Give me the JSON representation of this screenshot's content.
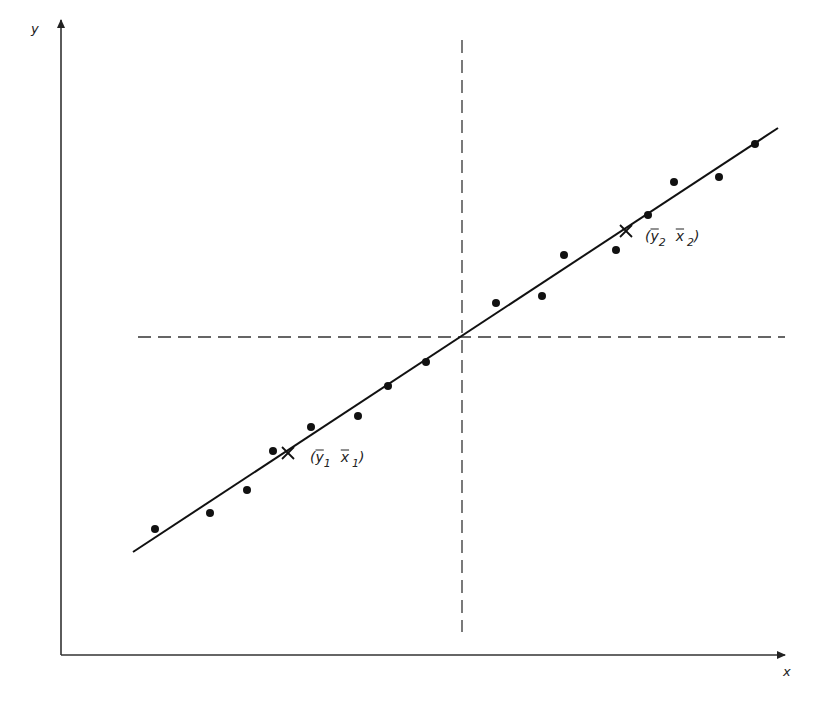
{
  "diagram": {
    "title": "",
    "axes": {
      "x_label": "x",
      "y_label": "y",
      "origin_px": [
        61,
        655
      ],
      "x_end_px": [
        785,
        655
      ],
      "y_end_px": [
        61,
        20
      ]
    },
    "reference_lines": {
      "vertical_dashed_x_px": 462,
      "vertical_dashed_range_px": [
        40,
        632
      ],
      "horizontal_dashed_y_px": 337,
      "horizontal_dashed_range_px": [
        138,
        785
      ],
      "description": "dashed lines through the grand mean"
    },
    "regression_line": {
      "start_px": [
        133,
        552
      ],
      "end_px": [
        778,
        128
      ],
      "passes_through": "grand mean (intersection of dashed lines)"
    },
    "group_means": [
      {
        "label_open": "(",
        "y_sym": "y",
        "y_sub": "1",
        "x_sym": "x",
        "x_sub": "1",
        "label_close": ")",
        "marker_px": [
          288,
          453
        ],
        "label_px": [
          310,
          462
        ]
      },
      {
        "label_open": "(",
        "y_sym": "y",
        "y_sub": "2",
        "x_sym": "x",
        "x_sub": "2",
        "label_close": ")",
        "marker_px": [
          626,
          231
        ],
        "label_px": [
          645,
          241
        ]
      }
    ],
    "data_points_px": [
      [
        155,
        529
      ],
      [
        210,
        513
      ],
      [
        247,
        490
      ],
      [
        273,
        451
      ],
      [
        311,
        427
      ],
      [
        358,
        416
      ],
      [
        388,
        386
      ],
      [
        426,
        362
      ],
      [
        496,
        303
      ],
      [
        542,
        296
      ],
      [
        564,
        255
      ],
      [
        616,
        250
      ],
      [
        648,
        215
      ],
      [
        674,
        182
      ],
      [
        719,
        177
      ],
      [
        755,
        144
      ]
    ]
  }
}
